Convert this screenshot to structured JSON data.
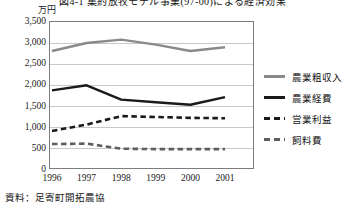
{
  "figure": {
    "title": "図4-1 集約放牧モデル事業(97-00)による経済効果",
    "unit_label": "万円",
    "source_note": "資料：足寄町開拓農協"
  },
  "chart_data": {
    "type": "line",
    "xlabel": "",
    "ylabel": "万円",
    "categories": [
      "1996",
      "1997",
      "1998",
      "1999",
      "2000",
      "2001"
    ],
    "ylim": [
      0,
      3500
    ],
    "ytick_labels": [
      "0",
      "500",
      "1,000",
      "1,500",
      "2,000",
      "2,500",
      "3,000",
      "3,500"
    ],
    "ytick_values": [
      0,
      500,
      1000,
      1500,
      2000,
      2500,
      3000,
      3500
    ],
    "grid": true,
    "legend_position": "right",
    "series": [
      {
        "name": "農業粗収入",
        "color": "#8a8a8a",
        "style": "solid",
        "values": [
          2790,
          2980,
          3060,
          2940,
          2790,
          2880
        ]
      },
      {
        "name": "農業経費",
        "color": "#1a1a1a",
        "style": "solid",
        "values": [
          1860,
          1980,
          1640,
          1580,
          1520,
          1700
        ]
      },
      {
        "name": "営業利益",
        "color": "#1a1a1a",
        "style": "dashed",
        "values": [
          900,
          1050,
          1250,
          1230,
          1210,
          1200
        ]
      },
      {
        "name": "飼料費",
        "color": "#5e5e5e",
        "style": "dashed",
        "values": [
          590,
          600,
          480,
          470,
          470,
          470
        ]
      }
    ]
  },
  "legend": {
    "items": [
      {
        "label": "農業粗収入",
        "color": "#8a8a8a",
        "style": "solid"
      },
      {
        "label": "農業経費",
        "color": "#1a1a1a",
        "style": "solid"
      },
      {
        "label": "営業利益",
        "color": "#1a1a1a",
        "style": "dashed"
      },
      {
        "label": "飼料費",
        "color": "#5e5e5e",
        "style": "dashed"
      }
    ]
  }
}
